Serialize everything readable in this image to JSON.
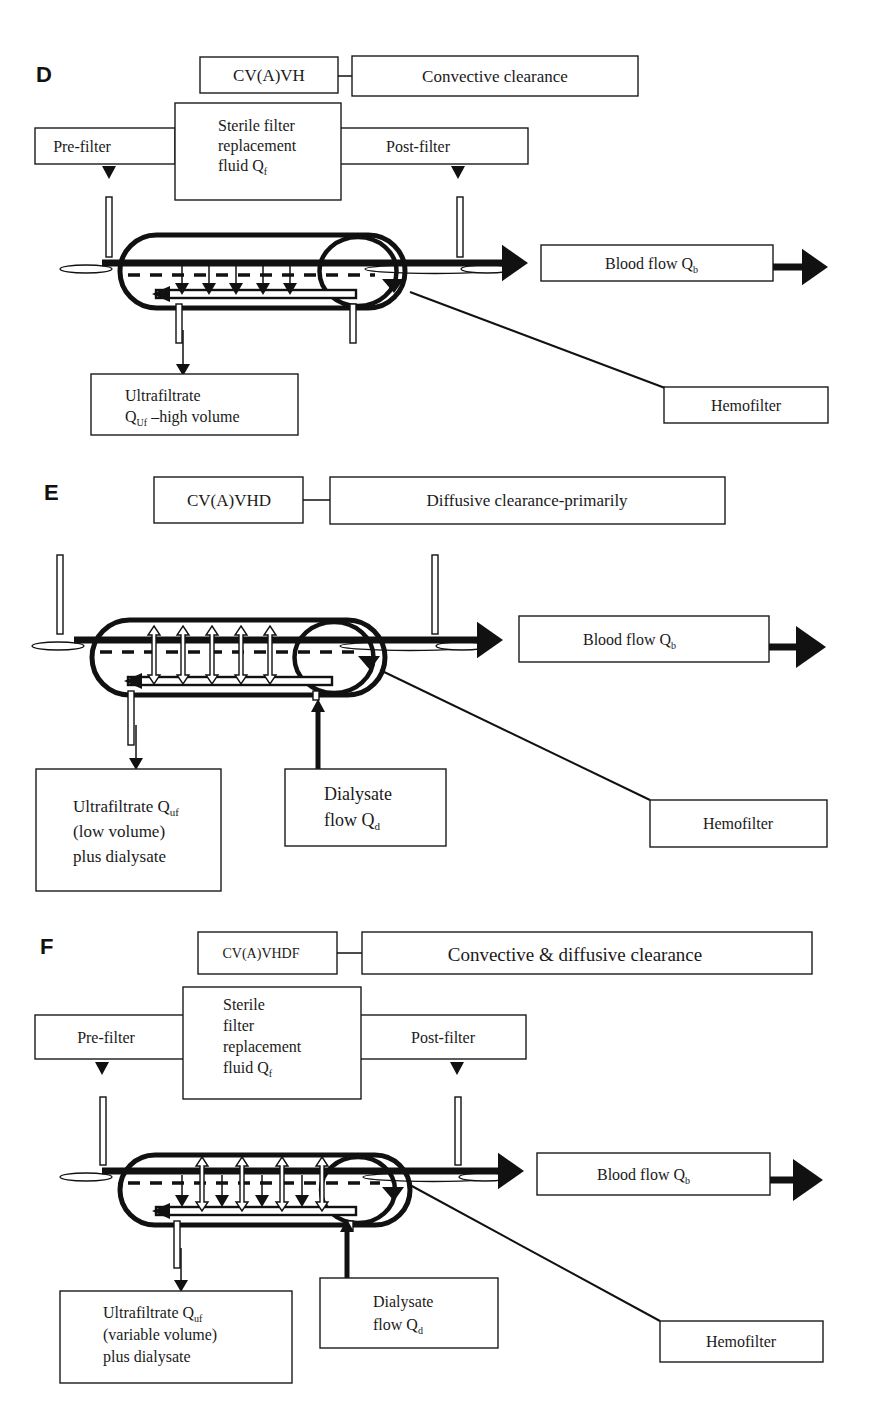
{
  "panels": [
    {
      "id": "D",
      "letter": "D",
      "mode": "CV(A)VH",
      "clearance": "Convective clearance",
      "pre_filter": "Pre-filter",
      "post_filter": "Post-filter",
      "replacement": [
        "Sterile filter",
        "replacement",
        "fluid Q",
        "f"
      ],
      "blood_flow": [
        "Blood flow Q",
        "b"
      ],
      "ultrafiltrate": [
        [
          "Ultrafiltrate"
        ],
        [
          "Q",
          "Uf",
          " –high volume"
        ]
      ],
      "hemofilter": "Hemofilter",
      "membrane_arrows": "convective"
    },
    {
      "id": "E",
      "letter": "E",
      "mode": "CV(A)VHD",
      "clearance": "Diffusive clearance-primarily",
      "blood_flow": [
        "Blood flow Q",
        "b"
      ],
      "ultrafiltrate": [
        [
          "Ultrafiltrate Q",
          "uf"
        ],
        [
          "(low volume)"
        ],
        [
          "plus dialysate"
        ]
      ],
      "dialysate": [
        [
          "Dialysate"
        ],
        [
          "flow Q",
          "d"
        ]
      ],
      "hemofilter": "Hemofilter",
      "membrane_arrows": "diffusive"
    },
    {
      "id": "F",
      "letter": "F",
      "mode": "CV(A)VHDF",
      "clearance": "Convective & diffusive clearance",
      "pre_filter": "Pre-filter",
      "post_filter": "Post-filter",
      "replacement": [
        "Sterile",
        "filter",
        "replacement",
        "fluid Q",
        "f"
      ],
      "blood_flow": [
        "Blood flow Q",
        "b"
      ],
      "ultrafiltrate": [
        [
          "Ultrafiltrate Q",
          "uf"
        ],
        [
          "(variable volume)"
        ],
        [
          "plus dialysate"
        ]
      ],
      "dialysate": [
        [
          "Dialysate"
        ],
        [
          "flow Q",
          "d"
        ]
      ],
      "hemofilter": "Hemofilter",
      "membrane_arrows": "mixed"
    }
  ],
  "colors": {
    "ink": "#111111",
    "box_stroke": "#1a1a1a",
    "background": "#ffffff"
  }
}
